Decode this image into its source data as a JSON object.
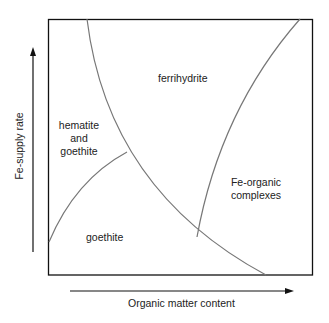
{
  "diagram": {
    "axes": {
      "x_label": "Organic matter content",
      "y_label": "Fe-supply rate"
    },
    "regions": {
      "ferrihydrite": "ferrihydrite",
      "hematite_line1": "hematite",
      "hematite_line2": "and",
      "hematite_line3": "goethite",
      "goethite": "goethite",
      "feorganic_line1": "Fe-organic",
      "feorganic_line2": "complexes"
    },
    "colors": {
      "frame": "#111111",
      "curve": "#777777",
      "text": "#222222"
    }
  }
}
